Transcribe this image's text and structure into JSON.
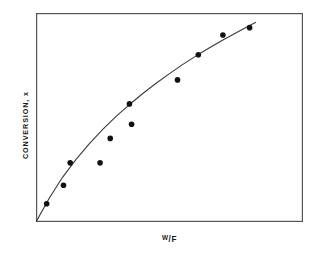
{
  "figure": {
    "panel_tag": "(a)",
    "background_color": "#ffffff",
    "frame_color": "#555555",
    "curve_color": "#3a3a3a",
    "marker_color": "#111111"
  },
  "axes": {
    "y_label": "CONVERSION, x",
    "x_label_numerator": "W",
    "x_label_slash": "/",
    "x_label_denominator": "F",
    "x_label_full": "W/F"
  },
  "chart_data": {
    "type": "scatter",
    "title": "(a)",
    "xlabel": "W/F",
    "ylabel": "CONVERSION, x",
    "xlim": [
      0,
      1
    ],
    "ylim": [
      0,
      1
    ],
    "grid": false,
    "legend": null,
    "axis_ticks": false,
    "axis_tick_labels": false,
    "series": [
      {
        "name": "experimental data",
        "type": "scatter",
        "marker": "filled-circle",
        "marker_size_px": 5.6,
        "x": [
          0.04,
          0.103,
          0.128,
          0.24,
          0.278,
          0.35,
          0.358,
          0.53,
          0.608,
          0.7,
          0.8
        ],
        "y": [
          0.087,
          0.176,
          0.283,
          0.283,
          0.4,
          0.565,
          0.468,
          0.68,
          0.8,
          0.895,
          0.93
        ]
      },
      {
        "name": "fitted curve",
        "type": "line",
        "x": [
          0.0,
          0.05,
          0.1,
          0.15,
          0.2,
          0.25,
          0.3,
          0.35,
          0.4,
          0.45,
          0.5,
          0.55,
          0.6,
          0.65,
          0.7,
          0.75,
          0.8,
          0.822
        ],
        "y": [
          0.0,
          0.115,
          0.215,
          0.3,
          0.375,
          0.443,
          0.505,
          0.562,
          0.615,
          0.664,
          0.71,
          0.754,
          0.795,
          0.834,
          0.871,
          0.906,
          0.94,
          0.955
        ]
      }
    ]
  }
}
